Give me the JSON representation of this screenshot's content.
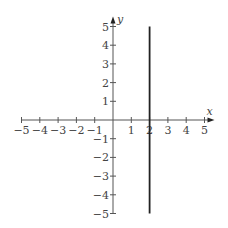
{
  "chart_data": {
    "type": "line",
    "title": "",
    "xlabel": "x",
    "ylabel": "y",
    "xlim": [
      -5,
      5
    ],
    "ylim": [
      -5,
      5
    ],
    "x_ticks": [
      -5,
      -4,
      -3,
      -2,
      -1,
      1,
      2,
      3,
      4,
      5
    ],
    "y_ticks": [
      -5,
      -4,
      -3,
      -2,
      -1,
      1,
      2,
      3,
      4,
      5
    ],
    "x_tick_labels": [
      "−5",
      "−4",
      "−3",
      "−2",
      "−1",
      "1",
      "2",
      "3",
      "4",
      "5"
    ],
    "y_tick_labels": [
      "−5",
      "−4",
      "−3",
      "−2",
      "−1",
      "1",
      "2",
      "3",
      "4",
      "5"
    ],
    "grid": false,
    "series": [
      {
        "name": "x = 2",
        "points": [
          [
            2,
            -5
          ],
          [
            2,
            5
          ]
        ],
        "color": "#222222"
      }
    ],
    "axis_color": "#555555"
  }
}
